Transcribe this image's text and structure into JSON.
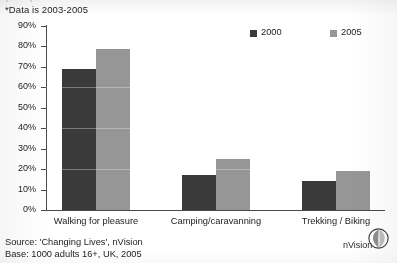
{
  "note": "*Data is 2003-2005",
  "cut_header_ghost": "participation in outdoor activities",
  "chart_data": {
    "type": "bar",
    "title": "",
    "subtitle": "*Data is 2003-2005",
    "xlabel": "",
    "ylabel": "",
    "categories": [
      "Walking for pleasure",
      "Camping/caravanning",
      "Trekking / Biking"
    ],
    "series": [
      {
        "name": "2000",
        "color": "#3a3a3a",
        "values": [
          69,
          17,
          14
        ]
      },
      {
        "name": "2005",
        "color": "#969696",
        "values": [
          79,
          25,
          19
        ]
      }
    ],
    "ylim": [
      0,
      90
    ],
    "yticks": [
      "0%",
      "10%",
      "20%",
      "30%",
      "40%",
      "50%",
      "60%",
      "70%",
      "80%",
      "90%"
    ],
    "grid": false,
    "legend_position": "top-right"
  },
  "legend": [
    {
      "label": "2000",
      "color": "#3a3a3a"
    },
    {
      "label": "2005",
      "color": "#969696"
    }
  ],
  "footer": {
    "source": "Source: 'Changing Lives', nVision",
    "base": "Base: 1000 adults 16+, UK, 2005"
  },
  "brand": {
    "name": "nVision"
  }
}
